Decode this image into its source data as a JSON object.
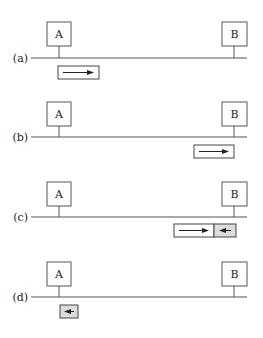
{
  "diagram": {
    "nodes": [
      {
        "id": "A",
        "label": "A"
      },
      {
        "id": "B",
        "label": "B"
      }
    ],
    "panels": [
      {
        "id": "a",
        "label": "(a)",
        "frames": [
          {
            "near": "A",
            "direction": "right",
            "shaded": false,
            "kind": "long"
          }
        ]
      },
      {
        "id": "b",
        "label": "(b)",
        "frames": [
          {
            "near": "B",
            "direction": "right",
            "shaded": false,
            "kind": "long"
          }
        ]
      },
      {
        "id": "c",
        "label": "(c)",
        "frames": [
          {
            "near": "B",
            "direction": "right",
            "shaded": false,
            "kind": "long"
          },
          {
            "near": "B",
            "direction": "left",
            "shaded": true,
            "kind": "short"
          }
        ]
      },
      {
        "id": "d",
        "label": "(d)",
        "frames": [
          {
            "near": "A",
            "direction": "left",
            "shaded": true,
            "kind": "short"
          }
        ]
      }
    ]
  },
  "colors": {
    "line": "#555555",
    "shaded_frame": "#dcdcdc",
    "arrow": "#222222"
  }
}
